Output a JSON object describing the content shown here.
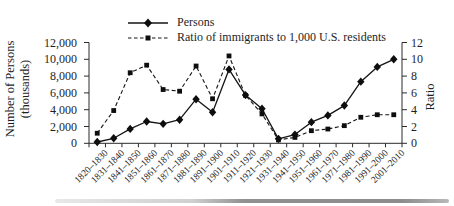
{
  "legend": {
    "persons_label": "Persons",
    "ratio_label": "Ratio of immigrants to 1,000 U.S. residents"
  },
  "axes": {
    "left_title_line1": "Number of Persons",
    "left_title_line2": "(thousands)",
    "right_title": "Ratio",
    "left_ticks": [
      "12,000",
      "10,000",
      "8,000",
      "6,000",
      "4,000",
      "2,000",
      "0"
    ],
    "right_ticks": [
      "12",
      "10",
      "8",
      "6",
      "4",
      "2",
      "0"
    ]
  },
  "chart_data": {
    "type": "line",
    "categories": [
      "1820–1830",
      "1831–1840",
      "1841–1850",
      "1851–1860",
      "1861–1870",
      "1871–1880",
      "1881–1890",
      "1891–1900",
      "1901–1910",
      "1911–1920",
      "1921–1930",
      "1931–1940",
      "1941–1950",
      "1951–1960",
      "1961–1970",
      "1971–1980",
      "1981–1990",
      "1991–2000",
      "2001–2010"
    ],
    "series": [
      {
        "name": "Persons",
        "axis": "left",
        "line": "solid",
        "marker": "diamond",
        "values": [
          152,
          599,
          1713,
          2598,
          2315,
          2812,
          5247,
          3688,
          8795,
          5736,
          4107,
          528,
          1035,
          2515,
          3322,
          4493,
          7338,
          9095,
          10000
        ]
      },
      {
        "name": "Ratio of immigrants to 1,000 U.S. residents",
        "axis": "right",
        "line": "dashed",
        "marker": "square",
        "values": [
          1.2,
          3.9,
          8.4,
          9.3,
          6.4,
          6.2,
          9.2,
          5.3,
          10.4,
          5.7,
          3.5,
          0.4,
          0.7,
          1.5,
          1.7,
          2.1,
          3.1,
          3.4,
          3.4
        ]
      }
    ],
    "ylabel_left": "Number of Persons (thousands)",
    "ylabel_right": "Ratio",
    "ylim_left": [
      0,
      12000
    ],
    "ylim_right": [
      0,
      12
    ],
    "ytick_step_left": 2000,
    "ytick_step_right": 2,
    "grid": false,
    "legend_position": "top-center"
  }
}
